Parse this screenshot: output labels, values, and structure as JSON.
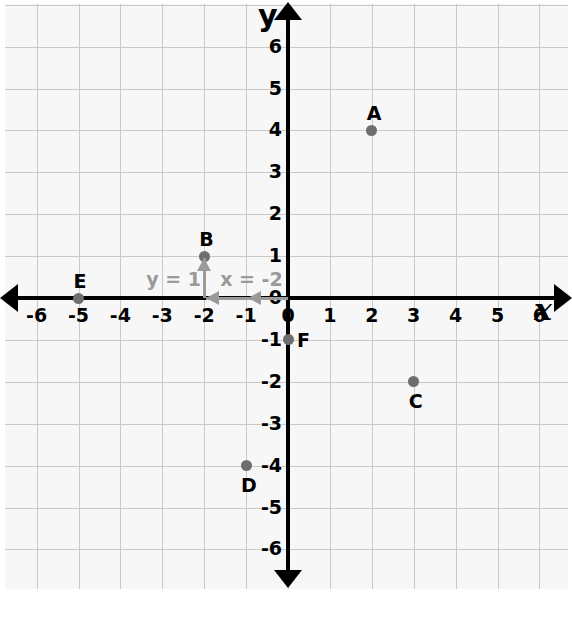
{
  "chart_data": {
    "type": "scatter",
    "title": "",
    "xlabel": "x",
    "ylabel": "y",
    "xlim": [
      -6,
      6
    ],
    "ylim": [
      -6,
      6
    ],
    "grid": true,
    "legend": "none",
    "x_ticks": [
      "-6",
      "-5",
      "-4",
      "-3",
      "-2",
      "-1",
      "0",
      "1",
      "2",
      "3",
      "4",
      "5",
      "6"
    ],
    "y_ticks": [
      "6",
      "5",
      "4",
      "3",
      "2",
      "1",
      "0",
      "-1",
      "-2",
      "-3",
      "-4",
      "-5",
      "-6"
    ],
    "points": [
      {
        "label": "A",
        "x": 2,
        "y": 4,
        "label_pos": "above"
      },
      {
        "label": "B",
        "x": -2,
        "y": 1,
        "label_pos": "above"
      },
      {
        "label": "C",
        "x": 3,
        "y": -2,
        "label_pos": "below"
      },
      {
        "label": "D",
        "x": -1,
        "y": -4,
        "label_pos": "below"
      },
      {
        "label": "E",
        "x": -5,
        "y": 0,
        "label_pos": "above"
      },
      {
        "label": "F",
        "x": 0,
        "y": -1,
        "label_pos": "right"
      }
    ],
    "annotations": [
      {
        "name": "y-value-annotation",
        "text": "y = 1",
        "color": "#9a9a9a",
        "direction": "up",
        "from": [
          -2,
          0
        ],
        "to": [
          -2,
          1
        ]
      },
      {
        "name": "x-value-annotation",
        "text": "x = -2",
        "color": "#9a9a9a",
        "direction": "left",
        "from": [
          0,
          0
        ],
        "to": [
          -2,
          0
        ]
      }
    ],
    "colors": {
      "point": "#6e6e6e",
      "axis": "#000000",
      "grid": "#c9c9c9",
      "annotation": "#9a9a9a",
      "paper": "#f7f7f7"
    }
  },
  "axis_names": {
    "x": "x",
    "y": "y"
  },
  "tick_labels": {
    "x": [
      "-6",
      "-5",
      "-4",
      "-3",
      "-2",
      "-1",
      "0",
      "1",
      "2",
      "3",
      "4",
      "5",
      "6"
    ],
    "y_positive": [
      "6",
      "5",
      "4",
      "3",
      "2",
      "1"
    ],
    "y_origin": "0",
    "y_negative": [
      "-1",
      "-2",
      "-3",
      "-4",
      "-5",
      "-6"
    ]
  },
  "point_labels": {
    "a": "A",
    "b": "B",
    "c": "C",
    "d": "D",
    "e": "E",
    "f": "F"
  },
  "annotation_labels": {
    "y_eq": "y = 1",
    "x_eq": "x = -2"
  }
}
